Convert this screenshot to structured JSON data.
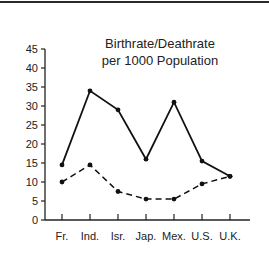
{
  "chart_data": {
    "type": "line",
    "title_lines": [
      "Birthrate/Deathrate",
      "per 1000 Population"
    ],
    "xlabel": "",
    "ylabel": "",
    "categories": [
      "Fr.",
      "Ind.",
      "Isr.",
      "Jap.",
      "Mex.",
      "U.S.",
      "U.K."
    ],
    "series": [
      {
        "name": "Birthrate",
        "style": "solid",
        "values": [
          14.5,
          34,
          29,
          16,
          31,
          15.5,
          11.5
        ]
      },
      {
        "name": "Deathrate",
        "style": "dashed",
        "values": [
          10,
          14.5,
          7.5,
          5.5,
          5.5,
          9.5,
          11.5
        ]
      }
    ],
    "yticks": [
      0,
      5,
      10,
      15,
      20,
      25,
      30,
      35,
      40,
      45
    ],
    "ylim": [
      0,
      45
    ],
    "grid": false,
    "legend": "none"
  }
}
